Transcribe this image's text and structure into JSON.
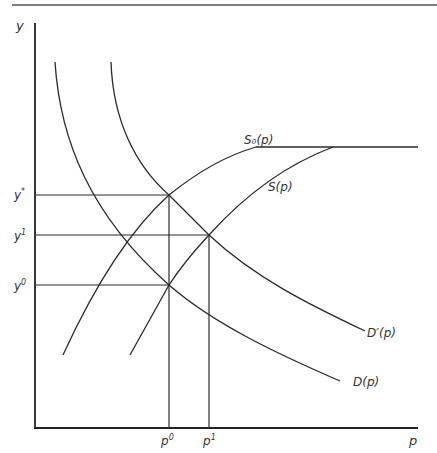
{
  "figure": {
    "colors": {
      "line": "#2a2a2a",
      "text": "#333333",
      "background": "#ffffff"
    },
    "axes": {
      "y_label": "y",
      "x_label": "p"
    },
    "y_ticks": [
      {
        "id": "y_star",
        "label_base": "y",
        "label_sup": "*",
        "y_px": 195
      },
      {
        "id": "y_one",
        "label_base": "y",
        "label_sup": "1",
        "y_px": 235
      },
      {
        "id": "y_zero",
        "label_base": "y",
        "label_sup": "0",
        "y_px": 285
      }
    ],
    "x_ticks": [
      {
        "id": "p_zero",
        "label_base": "p",
        "label_sup": "0",
        "x_px": 169
      },
      {
        "id": "p_one",
        "label_base": "p",
        "label_sup": "1",
        "x_px": 209
      }
    ],
    "curves": [
      {
        "id": "S0",
        "label": "S₀(p)",
        "kind": "supply, capped"
      },
      {
        "id": "S",
        "label": "S(p)",
        "kind": "supply, capped"
      },
      {
        "id": "D",
        "label": "D(p)",
        "kind": "demand"
      },
      {
        "id": "Dprime",
        "label": "D′(p)",
        "kind": "demand, shifted"
      }
    ],
    "labels": {
      "S0": "S₀(p)",
      "S": "S(p)",
      "D": "D(p)",
      "Dprime": "D′(p)"
    },
    "equilibria": [
      {
        "curves": [
          "S0",
          "Dprime"
        ],
        "p": "p0",
        "y": "y*"
      },
      {
        "curves": [
          "S",
          "Dprime"
        ],
        "p": "p1",
        "y": "y1"
      },
      {
        "curves": [
          "S",
          "D"
        ],
        "p": "p0",
        "y": "y0"
      }
    ]
  }
}
